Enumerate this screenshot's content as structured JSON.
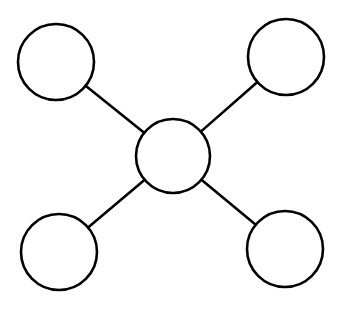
{
  "diagram": {
    "type": "star-graph",
    "stroke_color": "#000000",
    "fill_color": "#ffffff",
    "stroke_width": 2.6,
    "nodes": [
      {
        "id": "center",
        "cx": 173,
        "cy": 156,
        "r": 37
      },
      {
        "id": "top-left",
        "cx": 56,
        "cy": 62,
        "r": 38
      },
      {
        "id": "top-right",
        "cx": 286,
        "cy": 57,
        "r": 38
      },
      {
        "id": "bottom-left",
        "cx": 59,
        "cy": 252,
        "r": 38
      },
      {
        "id": "bottom-right",
        "cx": 285,
        "cy": 249,
        "r": 38
      }
    ],
    "edges": [
      {
        "from": "center",
        "to": "top-left"
      },
      {
        "from": "center",
        "to": "top-right"
      },
      {
        "from": "center",
        "to": "bottom-left"
      },
      {
        "from": "center",
        "to": "bottom-right"
      }
    ]
  }
}
